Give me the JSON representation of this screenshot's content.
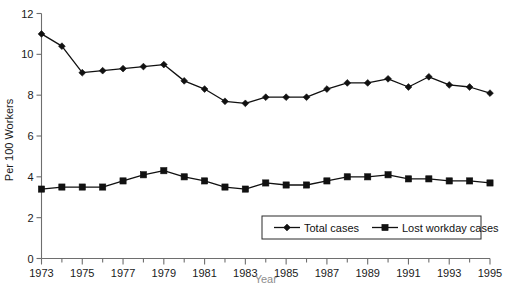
{
  "chart_data": {
    "type": "line",
    "title": "",
    "subtitle": "",
    "xlabel": "Year",
    "ylabel": "Per 100 Workers",
    "x": [
      1973,
      1974,
      1975,
      1976,
      1977,
      1978,
      1979,
      1980,
      1981,
      1982,
      1983,
      1984,
      1985,
      1986,
      1987,
      1988,
      1989,
      1990,
      1991,
      1992,
      1993,
      1994,
      1995
    ],
    "xlim": [
      1973,
      1995
    ],
    "ylim": [
      0,
      12
    ],
    "ytick_labels": [
      "0",
      "2",
      "4",
      "6",
      "8",
      "10",
      "12"
    ],
    "yticks": [
      0,
      2,
      4,
      6,
      8,
      10,
      12
    ],
    "xtick_labels": [
      "1973",
      "1975",
      "1977",
      "1979",
      "1981",
      "1983",
      "1985",
      "1987",
      "1989",
      "1991",
      "1993",
      "1995"
    ],
    "xticks_major": [
      1973,
      1975,
      1977,
      1979,
      1981,
      1983,
      1985,
      1987,
      1989,
      1991,
      1993,
      1995
    ],
    "grid": false,
    "legend_position": "bottom-right",
    "series": [
      {
        "name": "Total cases",
        "marker": "diamond",
        "values": [
          11.0,
          10.4,
          9.1,
          9.2,
          9.3,
          9.4,
          9.5,
          8.7,
          8.3,
          7.7,
          7.6,
          7.9,
          7.9,
          7.9,
          8.3,
          8.6,
          8.6,
          8.8,
          8.4,
          8.9,
          8.5,
          8.4,
          8.1
        ]
      },
      {
        "name": "Lost workday cases",
        "marker": "square",
        "values": [
          3.4,
          3.5,
          3.5,
          3.5,
          3.8,
          4.1,
          4.3,
          4.0,
          3.8,
          3.5,
          3.4,
          3.7,
          3.6,
          3.6,
          3.8,
          4.0,
          4.0,
          4.1,
          3.9,
          3.9,
          3.8,
          3.8,
          3.7
        ]
      }
    ]
  },
  "colors": {
    "series_ink": "#111111",
    "axis": "#6e6e6e",
    "text": "#1a1a1a",
    "background": "#ffffff"
  },
  "legend": {
    "entries": [
      {
        "label": "Total cases",
        "marker": "diamond"
      },
      {
        "label": "Lost workday cases",
        "marker": "square"
      }
    ]
  }
}
